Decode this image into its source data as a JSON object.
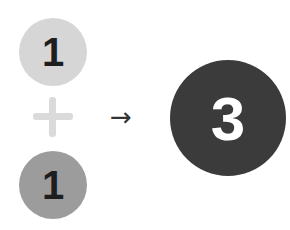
{
  "diagram": {
    "operand_a": {
      "label": "1",
      "color": "#d6d6d6"
    },
    "operator": {
      "symbol": "plus",
      "color": "#dadada"
    },
    "operand_b": {
      "label": "1",
      "color": "#9c9c9c"
    },
    "arrow": {
      "symbol": "→"
    },
    "result": {
      "label": "3",
      "color": "#3b3b3b"
    }
  }
}
